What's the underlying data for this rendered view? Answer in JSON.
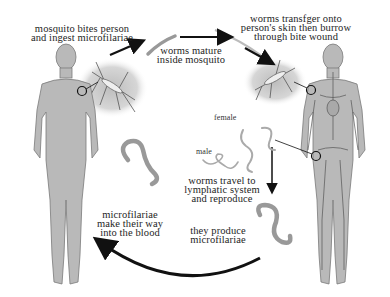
{
  "steps": [
    {
      "id": "bite",
      "text_lines": [
        "mosquito bites person",
        "and ingest microfilariae"
      ]
    },
    {
      "id": "mature",
      "text_lines": [
        "worms mature",
        "inside mosquito"
      ]
    },
    {
      "id": "transfer",
      "text_lines": [
        "worms transfger onto",
        "person's skin then burrow",
        "through bite wound"
      ]
    },
    {
      "id": "travel",
      "text_lines": [
        "worms travel to",
        "lymphatic system",
        "and reproduce"
      ]
    },
    {
      "id": "produce",
      "text_lines": [
        "they produce",
        "microfilariae"
      ]
    },
    {
      "id": "blood",
      "text_lines": [
        "microfilariae",
        "make their way",
        "into the blood"
      ]
    }
  ],
  "worm_labels": {
    "female": "female",
    "male": "male"
  },
  "figures": {
    "left": "human body (infected via mosquito bite)",
    "right": "human body with lymphatic system shown"
  },
  "colors": {
    "body": "#b9b9b9",
    "body_outline": "#7a7a7a",
    "arrow": "#111111",
    "worm": "#9a9a9a",
    "halo": "#cfcfcf"
  }
}
